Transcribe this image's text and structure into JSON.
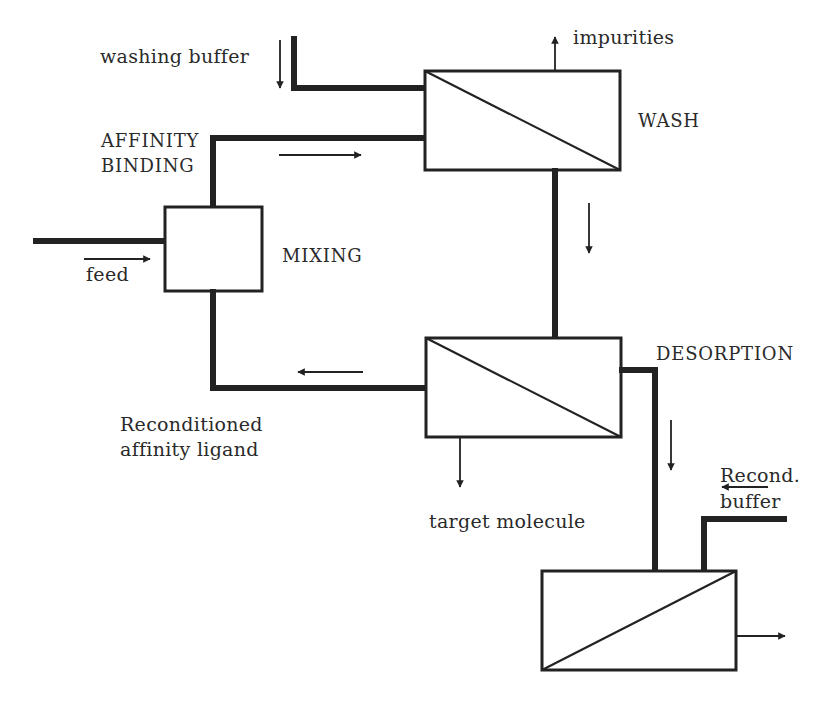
{
  "diagram": {
    "type": "process-flow",
    "colors": {
      "line": "#222222",
      "background": "#ffffff"
    },
    "nodes": [
      {
        "id": "mixing",
        "label": "MIXING",
        "shape": "box"
      },
      {
        "id": "wash",
        "label": "WASH",
        "shape": "membrane-box"
      },
      {
        "id": "desorption",
        "label": "DESORPTION",
        "shape": "membrane-box"
      },
      {
        "id": "recondition",
        "label": "",
        "shape": "membrane-box"
      }
    ],
    "edges": [
      {
        "from": "feed",
        "to": "mixing",
        "label": "feed"
      },
      {
        "from": "washing_buffer",
        "to": "wash",
        "label": "washing buffer"
      },
      {
        "from": "mixing",
        "to": "wash",
        "label": "AFFINITY BINDING"
      },
      {
        "from": "wash",
        "to": "impurities",
        "label": "impurities"
      },
      {
        "from": "wash",
        "to": "desorption",
        "label": ""
      },
      {
        "from": "desorption",
        "to": "target_molecule",
        "label": "target molecule"
      },
      {
        "from": "desorption",
        "to": "mixing",
        "label": "Reconditioned affinity ligand"
      },
      {
        "from": "desorption",
        "to": "recondition",
        "label": ""
      },
      {
        "from": "recond_buffer",
        "to": "recondition",
        "label": "Recond. buffer"
      },
      {
        "from": "recondition",
        "to": "outlet",
        "label": ""
      }
    ]
  },
  "labels": {
    "washing_buffer": "washing buffer",
    "impurities": "impurities",
    "wash": "WASH",
    "affinity_binding_line1": "AFFINITY",
    "affinity_binding_line2": "BINDING",
    "mixing": "MIXING",
    "feed": "feed",
    "desorption": "DESORPTION",
    "reconditioned_line1": "Reconditioned",
    "reconditioned_line2": "affinity ligand",
    "target_molecule": "target molecule",
    "recond_line1": "Recond.",
    "recond_line2": "buffer"
  }
}
